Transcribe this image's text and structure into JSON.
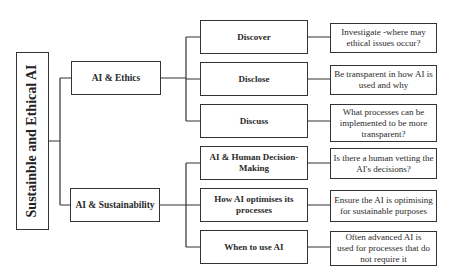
{
  "root": {
    "label": "Sustainble and Ethical AI"
  },
  "branches": [
    {
      "label": "AI & Ethics",
      "children": [
        {
          "label": "Discover",
          "detail": "Investigate -where may ethical issues occur?"
        },
        {
          "label": "Disclose",
          "detail": "Be transparent in how AI is used and why"
        },
        {
          "label": "Discuss",
          "detail": "What processes can be implemented to be more transparent?"
        }
      ]
    },
    {
      "label": "AI & Sustainability",
      "children": [
        {
          "label": "AI & Human Decision-Making",
          "detail": "Is there a human vetting the AI's decisions?"
        },
        {
          "label": "How AI optimises its processes",
          "detail": "Ensure the AI is optimising for sustainable purposes"
        },
        {
          "label": "When to use AI",
          "detail": "Often advanced AI is used for processes that do not require it"
        }
      ]
    }
  ]
}
